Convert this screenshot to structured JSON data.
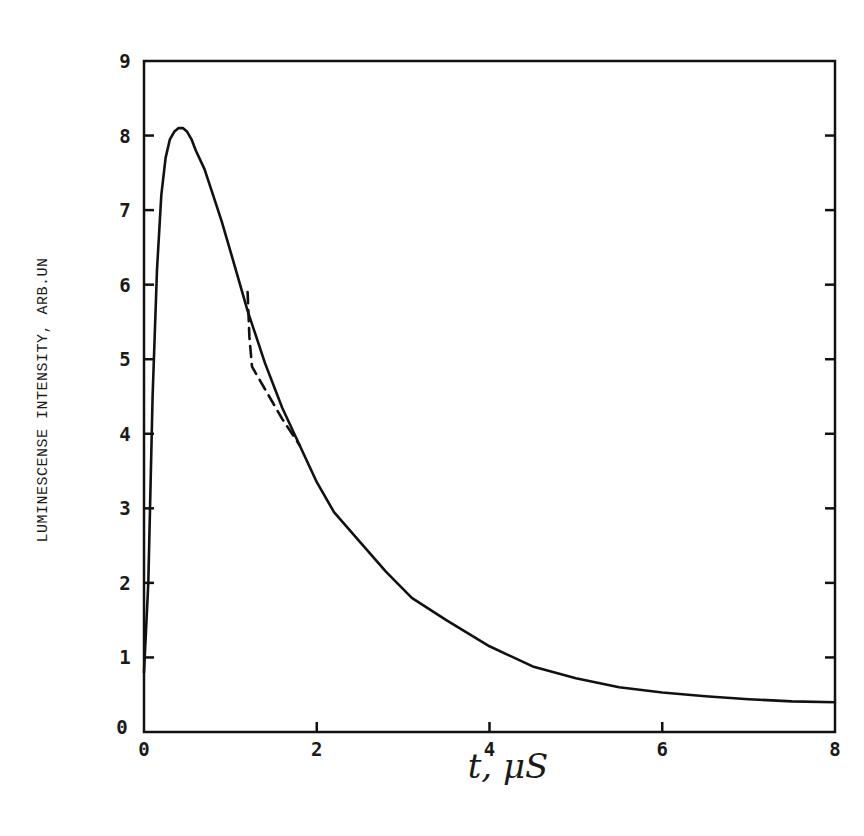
{
  "chart_data": {
    "type": "line",
    "title": "",
    "xlabel": "t, μS",
    "ylabel": "LUMINESCENSE INTENSITY, ARB.UN",
    "xlim": [
      0,
      8
    ],
    "ylim": [
      0,
      9
    ],
    "grid": false,
    "legend": null,
    "x_ticks": [
      0,
      2,
      4,
      6,
      8
    ],
    "y_ticks": [
      0,
      1,
      2,
      3,
      4,
      5,
      6,
      7,
      8,
      9
    ],
    "x_tick_labels": [
      "0",
      "2",
      "4",
      "6",
      "8"
    ],
    "y_tick_labels": [
      "0",
      "1",
      "2",
      "3",
      "4",
      "5",
      "6",
      "7",
      "8",
      "9"
    ],
    "series": [
      {
        "name": "solid",
        "style": "solid",
        "color": "#111111",
        "x": [
          0.0,
          0.05,
          0.1,
          0.15,
          0.2,
          0.25,
          0.3,
          0.35,
          0.4,
          0.45,
          0.5,
          0.55,
          0.6,
          0.7,
          0.8,
          0.9,
          1.0,
          1.1,
          1.2,
          1.3,
          1.4,
          1.6,
          1.8,
          2.0,
          2.2,
          2.5,
          2.8,
          3.1,
          3.5,
          4.0,
          4.5,
          5.0,
          5.5,
          6.0,
          6.5,
          7.0,
          7.5,
          8.0
        ],
        "y": [
          0.8,
          2.0,
          4.5,
          6.2,
          7.2,
          7.7,
          7.95,
          8.05,
          8.1,
          8.1,
          8.05,
          7.95,
          7.8,
          7.55,
          7.2,
          6.85,
          6.45,
          6.05,
          5.65,
          5.3,
          4.95,
          4.35,
          3.85,
          3.35,
          2.95,
          2.55,
          2.15,
          1.8,
          1.5,
          1.15,
          0.88,
          0.72,
          0.6,
          0.53,
          0.48,
          0.44,
          0.41,
          0.4
        ]
      },
      {
        "name": "dashed",
        "style": "dashed",
        "color": "#111111",
        "x": [
          1.2,
          1.22,
          1.25,
          1.4,
          1.6,
          1.8
        ],
        "y": [
          5.9,
          5.3,
          4.9,
          4.6,
          4.2,
          3.85
        ]
      }
    ]
  },
  "axes": {
    "xlabel": "t, μS",
    "ylabel": "LUMINESCENSE INTENSITY, ARB.UN"
  }
}
